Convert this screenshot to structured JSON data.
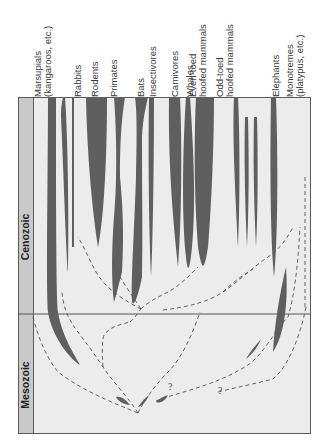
{
  "diagram": {
    "eras": [
      {
        "name": "Cenozoic"
      },
      {
        "name": "Mesozoic"
      }
    ],
    "groups": [
      {
        "label_line1": "Marsupials",
        "label_line2": "(kangaroos, etc.)"
      },
      {
        "label_line1": "Rabbits",
        "label_line2": ""
      },
      {
        "label_line1": "Rodents",
        "label_line2": ""
      },
      {
        "label_line1": "Primates",
        "label_line2": ""
      },
      {
        "label_line1": "Bats",
        "label_line2": ""
      },
      {
        "label_line1": "Insectivores",
        "label_line2": ""
      },
      {
        "label_line1": "Carnivores",
        "label_line2": ""
      },
      {
        "label_line1": "Whales",
        "label_line2": ""
      },
      {
        "label_line1": "Even-toed",
        "label_line2": "hoofed mammals"
      },
      {
        "label_line1": "Odd-toed",
        "label_line2": "hoofed mammals"
      },
      {
        "label_line1": "Elephants",
        "label_line2": ""
      },
      {
        "label_line1": "Monotremes",
        "label_line2": "(platypus, etc.)"
      }
    ],
    "uncertain_marks": [
      "?",
      "?"
    ],
    "colors": {
      "background": "#ececec",
      "era_band": "#c9c9c9",
      "branch_fill": "#5f5f5f",
      "lines": "#555555",
      "frame": "#5a5a5a"
    }
  }
}
